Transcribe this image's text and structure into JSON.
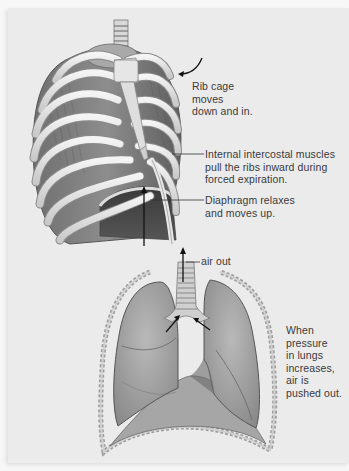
{
  "figure": {
    "style": "grayscale anatomical illustration",
    "background_color": "#ebebeb",
    "text_color": "#3a3a3a",
    "panels": [
      {
        "name": "rib-cage",
        "description": "Anterior view of rib cage with sternum, trachea and dome-shaped diaphragm",
        "annotations": [
          {
            "id": "ribcage",
            "text": "Rib cage\nmoves\ndown and in.",
            "pointer": "curved-arrow"
          },
          {
            "id": "intercostal",
            "text": "Internal intercostal muscles\npull the ribs inward during\nforced expiration.",
            "pointer": "leader-line"
          },
          {
            "id": "diaphragm",
            "text": "Diaphragm relaxes\nand moves up.",
            "pointer": "leader-line"
          }
        ],
        "arrows": [
          {
            "name": "diaphragm-up-arrow",
            "direction": "up"
          },
          {
            "name": "ribcage-inward-arrow",
            "direction": "down-left curved"
          }
        ]
      },
      {
        "name": "lungs",
        "description": "Frontal section of thoracic cavity showing lungs, trachea and diaphragm",
        "annotations": [
          {
            "id": "airout",
            "text": "air out",
            "pointer": "leader-line"
          },
          {
            "id": "pressure",
            "text": "When\npressure\nin lungs\nincreases,\nair is\npushed out.",
            "pointer": "none"
          }
        ],
        "arrows": [
          {
            "name": "air-out-arrow",
            "direction": "up"
          },
          {
            "name": "left-bronchus-arrow",
            "direction": "up-right"
          },
          {
            "name": "right-bronchus-arrow",
            "direction": "up-left"
          }
        ]
      }
    ]
  },
  "labels": {
    "ribcage": "Rib cage\nmoves\ndown and in.",
    "intercostal": "Internal intercostal muscles\npull the ribs inward during\nforced expiration.",
    "diaphragm": "Diaphragm relaxes\nand moves up.",
    "airout": "air out",
    "pressure": "When\npressure\nin lungs\nincreases,\nair is\npushed out."
  }
}
